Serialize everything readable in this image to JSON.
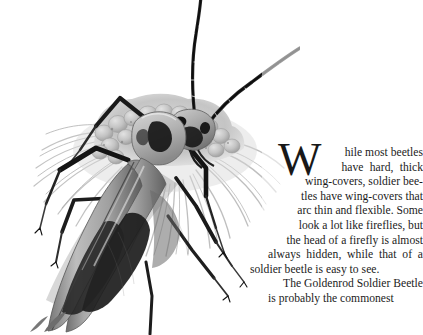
{
  "page": {
    "background_color": "#ffffff",
    "text_color": "#1b1b1b"
  },
  "illustration": {
    "caption_name": "goldenrod-soldier-beetle-on-flower",
    "subject": "soldier beetle",
    "description": "Grayscale pencil illustration of a soldier beetle perched on a flower head, with long segmented antennae, six legs and elongated wing-covers bearing dark markings.",
    "style": "grayscale pencil drawing",
    "colors": {
      "ink_dark": "#1a1a1a",
      "body_mid": "#8d8d8d",
      "body_light": "#c9c9c9",
      "petal_gray": "#b8b8b8",
      "shadow": "#5a5a5a"
    }
  },
  "article": {
    "dropcap": "W",
    "lines": [
      "hile most beetles",
      "have  hard,  thick",
      "wing-covers, soldier bee-",
      "tles have wing-covers that",
      "arc thin and flexible. Some",
      "look a lot like fireflies, but",
      "the head of a firefly is almost",
      "always  hidden,  while  that  of  a",
      "soldier beetle is easy to see.",
      "The Goldenrod Soldier Beetle",
      "is probably the commonest"
    ],
    "paragraph_one": "While most beetles have hard, thick wing-covers, soldier beetles have wing-covers that arc thin and flexible. Some look a lot like fireflies, but the head of a firefly is almost always hidden, while that of a soldier beetle is easy to see.",
    "paragraph_two_start": "The Goldenrod Soldier Beetle"
  }
}
